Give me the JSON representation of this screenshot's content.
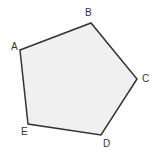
{
  "figure": {
    "kind": "geometry-diagram",
    "shape_name": "pentagon",
    "canvas": {
      "width": 156,
      "height": 159
    },
    "background_color": "#ffffff",
    "fill_color": "#f0f0f0",
    "stroke_color": "#333333",
    "stroke_width": 1.5,
    "label_color": "#333333",
    "label_font_size": 10,
    "vertices": [
      {
        "id": "A",
        "label": "A",
        "x": 20,
        "y": 50,
        "label_x": 11,
        "label_y": 42
      },
      {
        "id": "B",
        "label": "B",
        "x": 91,
        "y": 23,
        "label_x": 85,
        "label_y": 8
      },
      {
        "id": "C",
        "label": "C",
        "x": 137,
        "y": 79,
        "label_x": 142,
        "label_y": 74
      },
      {
        "id": "D",
        "label": "D",
        "x": 101,
        "y": 135,
        "label_x": 103,
        "label_y": 139
      },
      {
        "id": "E",
        "label": "E",
        "x": 28,
        "y": 124,
        "label_x": 21,
        "label_y": 127
      }
    ],
    "edges": [
      {
        "id": "AB",
        "from": "A",
        "to": "B"
      },
      {
        "id": "BC",
        "from": "B",
        "to": "C"
      },
      {
        "id": "CD",
        "from": "C",
        "to": "D"
      },
      {
        "id": "DE",
        "from": "D",
        "to": "E"
      },
      {
        "id": "EA",
        "from": "E",
        "to": "A"
      }
    ]
  }
}
